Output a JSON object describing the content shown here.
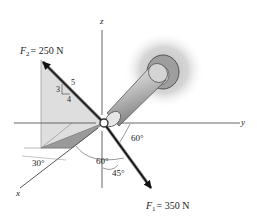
{
  "diagram": {
    "type": "3d-force-vector-diagram",
    "axes": {
      "x_label": "x",
      "y_label": "y",
      "z_label": "z"
    },
    "forces": [
      {
        "symbol": "F",
        "subscript": "2",
        "equals": "= 250 N",
        "magnitude": 250,
        "unit": "N",
        "slope_triangle": {
          "rise": "3",
          "run": "4",
          "hypotenuse": "5"
        },
        "plane_angle": "30°"
      },
      {
        "symbol": "F",
        "subscript": "1",
        "equals": "= 350 N",
        "magnitude": 350,
        "unit": "N",
        "angles": {
          "from_y": "60°",
          "from_x": "60°",
          "from_z": "45°"
        }
      }
    ],
    "angle_labels": {
      "a30": "30°",
      "a60_x": "60°",
      "a60_y": "60°",
      "a45": "45°"
    },
    "colors": {
      "axis": "#555555",
      "arrow": "#111111",
      "plane_light": "#d9d9d9",
      "plane_dark": "#9a9a9a",
      "wall_glow": "#c8c8c8",
      "pipe": "#b0b0b0"
    }
  }
}
